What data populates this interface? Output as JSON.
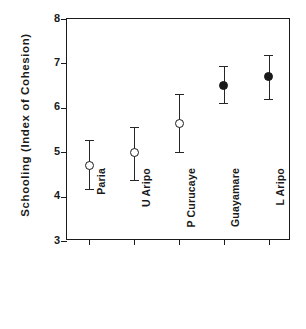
{
  "chart_data": {
    "type": "scatter",
    "title": "",
    "xlabel": "",
    "ylabel": "Schooling  (Index  of  Cohesion)",
    "ylim": [
      3,
      8
    ],
    "yticks": [
      3,
      4,
      5,
      6,
      7,
      8
    ],
    "ytick_labels": [
      "3",
      "4",
      "5",
      "6",
      "7",
      "8"
    ],
    "grid": false,
    "legend": "none",
    "categories": [
      "Paria",
      "U Aripo",
      "P Curucaye",
      "Guayamare",
      "L Aripo"
    ],
    "values": [
      4.7,
      5.0,
      5.65,
      6.5,
      6.7
    ],
    "error_low": [
      4.17,
      4.38,
      5.0,
      6.1,
      6.2
    ],
    "error_high": [
      5.27,
      5.57,
      6.32,
      6.95,
      7.2
    ],
    "marker_styles": [
      "open",
      "open",
      "open",
      "filled",
      "filled"
    ],
    "points": [
      {
        "category": "Paria",
        "value": 4.7,
        "low": 4.17,
        "high": 5.27,
        "marker": "open"
      },
      {
        "category": "U Aripo",
        "value": 5.0,
        "low": 4.38,
        "high": 5.57,
        "marker": "open"
      },
      {
        "category": "P Curucaye",
        "value": 5.65,
        "low": 5.0,
        "high": 6.32,
        "marker": "open"
      },
      {
        "category": "Guayamare",
        "value": 6.5,
        "low": 6.1,
        "high": 6.95,
        "marker": "filled"
      },
      {
        "category": "L Aripo",
        "value": 6.7,
        "low": 6.2,
        "high": 7.2,
        "marker": "filled"
      }
    ],
    "colors": {
      "axis": "#1a1a1a",
      "marker_line": "#1a1a1a",
      "marker_fill_open": "#ffffff",
      "marker_fill_closed": "#1a1a1a",
      "error_bar": "#262626",
      "background": "#ffffff"
    }
  }
}
